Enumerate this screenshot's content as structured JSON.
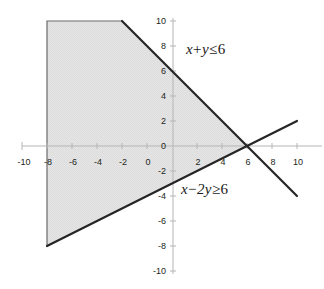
{
  "chart_data": {
    "type": "line",
    "title": "",
    "xlabel": "",
    "ylabel": "",
    "xlim": [
      -10,
      10
    ],
    "ylim": [
      -10,
      10
    ],
    "grid": false,
    "legend": "none",
    "xticks": [
      "-10",
      "-8",
      "-6",
      "-4",
      "-2",
      "0",
      "2",
      "4",
      "6",
      "8",
      "10"
    ],
    "xtick_values": [
      -10,
      -8,
      -6,
      -4,
      -2,
      0,
      2,
      4,
      6,
      8,
      10
    ],
    "yticks": [
      "10",
      "8",
      "6",
      "4",
      "2",
      "0",
      "-2",
      "-4",
      "-6",
      "-8",
      "-10"
    ],
    "ytick_values": [
      10,
      8,
      6,
      4,
      2,
      0,
      -2,
      -4,
      -6,
      -8,
      -10
    ],
    "series": [
      {
        "name": "x + y = 6",
        "equation": "x + y = 6",
        "slope": -1,
        "intercept": 6,
        "points": [
          [
            -4,
            10
          ],
          [
            10,
            -4
          ]
        ]
      },
      {
        "name": "x - 2y = 6",
        "equation": "x - 2y = 6",
        "slope": 0.5,
        "intercept": -3,
        "points": [
          [
            -10,
            -8
          ],
          [
            10,
            2
          ]
        ]
      }
    ],
    "shaded_region": {
      "name": "feasible-region",
      "fill": "#e2e2e2",
      "vertices": [
        [
          -10,
          10
        ],
        [
          -4,
          10
        ],
        [
          6,
          0
        ],
        [
          -10,
          -8
        ]
      ]
    },
    "annotations": [
      {
        "id": "ineq-1",
        "lhs_var1": "x",
        "operator1": "+",
        "lhs_var2": "y",
        "relation": "≤",
        "rhs": "6",
        "full": "x + y ≤ 6",
        "x": 186,
        "y": 48
      },
      {
        "id": "ineq-2",
        "lhs_var1": "x",
        "operator1": "−",
        "lhs_var2": "2y",
        "relation": "≥",
        "rhs": "6",
        "full": "x − 2y ≥ 6",
        "x": 181,
        "y": 188
      }
    ]
  },
  "colors": {
    "axis": "#b0b0b0",
    "line": "#2a2a2a",
    "fill": "#e2e2e2",
    "fill_edge": "#555555",
    "text": "#231f20",
    "background": "#ffffff"
  },
  "geometry": {
    "origin_x": 172,
    "origin_y": 146,
    "scale": 12.5
  }
}
